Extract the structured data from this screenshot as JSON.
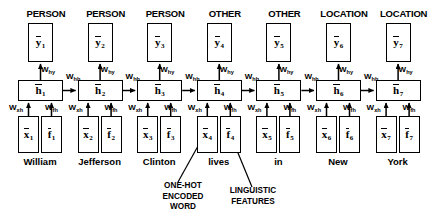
{
  "diagram": {
    "type": "rnn-unrolled-sequence",
    "colors": {
      "stroke": "#000000",
      "background": "#ffffff"
    },
    "weights": {
      "hy": "W",
      "hy_sub": "hy",
      "hh": "W",
      "hh_sub": "hh",
      "xh": "W",
      "xh_sub": "xh",
      "fh": "W",
      "fh_sub": "fh"
    },
    "symbols": {
      "y": "y",
      "h": "h",
      "x": "x",
      "f": "f"
    },
    "timesteps": [
      {
        "index": "1",
        "tag": "PERSON",
        "word": "William"
      },
      {
        "index": "2",
        "tag": "PERSON",
        "word": "Jefferson"
      },
      {
        "index": "3",
        "tag": "PERSON",
        "word": "Clinton"
      },
      {
        "index": "4",
        "tag": "OTHER",
        "word": "lives"
      },
      {
        "index": "5",
        "tag": "OTHER",
        "word": "in"
      },
      {
        "index": "6",
        "tag": "LOCATION",
        "word": "New"
      },
      {
        "index": "7",
        "tag": "LOCATION",
        "word": "York"
      }
    ],
    "annotations": {
      "one_hot": {
        "line1": "ONE-HOT",
        "line2": "ENCODED",
        "line3": "WORD"
      },
      "linguistic": {
        "line1": "LINGUISTIC",
        "line2": "FEATURES"
      }
    }
  }
}
